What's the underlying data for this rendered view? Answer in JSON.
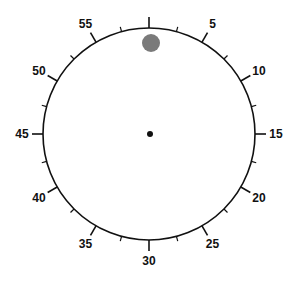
{
  "dial": {
    "type": "clock-face",
    "center": [
      149,
      134
    ],
    "radius": 106,
    "divisions": 60,
    "major_every": 5,
    "minor_every": 2.5,
    "labels": [
      {
        "value": 5,
        "text": "5"
      },
      {
        "value": 10,
        "text": "10"
      },
      {
        "value": 15,
        "text": "15"
      },
      {
        "value": 20,
        "text": "20"
      },
      {
        "value": 25,
        "text": "25"
      },
      {
        "value": 30,
        "text": "30"
      },
      {
        "value": 35,
        "text": "35"
      },
      {
        "value": 40,
        "text": "40"
      },
      {
        "value": 45,
        "text": "45"
      },
      {
        "value": 50,
        "text": "50"
      },
      {
        "value": 55,
        "text": "55"
      }
    ],
    "marker": {
      "position": 0,
      "color": "#7a7a7a",
      "radius": 9,
      "offset_from_center": 91
    },
    "center_dot": {
      "color": "#111111",
      "radius": 3
    },
    "line_color": "#111111"
  }
}
